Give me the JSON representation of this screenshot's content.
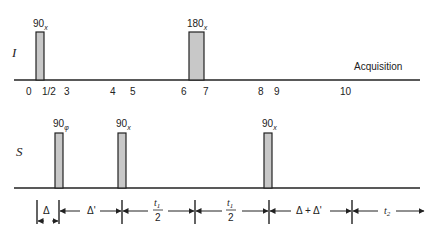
{
  "diagram": {
    "channels": [
      {
        "label": "I",
        "pulses": [
          {
            "angle": "90",
            "phase": "x",
            "position": 0.5,
            "kind": "90"
          },
          {
            "angle": "180",
            "phase": "x",
            "position": 6.5,
            "kind": "180"
          }
        ],
        "annotation": "Acquisition",
        "time_points": [
          "0",
          "1/2",
          "3",
          "4",
          "5",
          "6",
          "7",
          "8",
          "9",
          "10"
        ]
      },
      {
        "label": "S",
        "pulses": [
          {
            "angle": "90",
            "phase": "φ",
            "kind": "90"
          },
          {
            "angle": "90",
            "phase": "x",
            "kind": "90"
          },
          {
            "angle": "90",
            "phase": "x",
            "kind": "90"
          }
        ]
      }
    ],
    "intervals": [
      {
        "label": "Δ"
      },
      {
        "label": "Δ'"
      },
      {
        "label_num": "t",
        "label_num_sub": "1",
        "label_den": "2"
      },
      {
        "label_num": "t",
        "label_num_sub": "1",
        "label_den": "2"
      },
      {
        "label": "Δ + Δ'"
      },
      {
        "label_main": "t",
        "label_sub": "2"
      }
    ]
  }
}
